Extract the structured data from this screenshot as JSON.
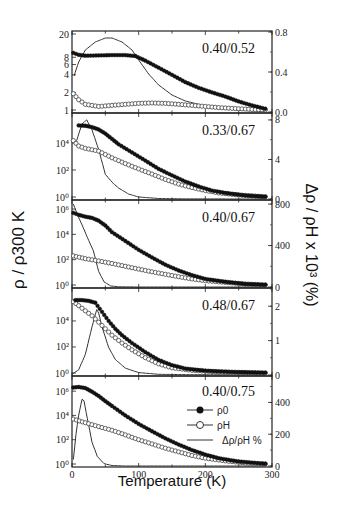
{
  "chart_data": {
    "type": "line",
    "xlabel": "Temperature (K)",
    "ylabel_left": "ρ / ρ300 K",
    "ylabel_right": "Δρ / ρH x 10³ (%)",
    "xlim": [
      0,
      300
    ],
    "xticks": [
      0,
      100,
      200,
      300
    ],
    "legend": {
      "panel": 4,
      "entries": [
        {
          "label": "ρ0",
          "marker": "filled-circle"
        },
        {
          "label": "ρH",
          "marker": "open-circle"
        },
        {
          "label": "Δρ/ρH %",
          "marker": "line"
        }
      ]
    },
    "panels": [
      {
        "label": "0.40/0.52",
        "left_scale": "log",
        "left_ylim": [
          1,
          20
        ],
        "left_ticks": [
          {
            "v": 1,
            "t": "1"
          },
          {
            "v": 2,
            "t": "2"
          },
          {
            "v": 4,
            "t": "4"
          },
          {
            "v": 6,
            "t": "6"
          },
          {
            "v": 8,
            "t": "8"
          },
          {
            "v": 20,
            "t": "20"
          }
        ],
        "right_ylim": [
          0,
          0.8
        ],
        "right_ticks": [
          {
            "v": 0,
            "t": "0.0"
          },
          {
            "v": 0.4,
            "t": "0.4"
          },
          {
            "v": 0.8,
            "t": "0.8"
          }
        ],
        "rho0": [
          [
            2,
            9.5
          ],
          [
            10,
            8.8
          ],
          [
            20,
            8.5
          ],
          [
            40,
            8.6
          ],
          [
            60,
            8.7
          ],
          [
            80,
            8.7
          ],
          [
            95,
            8.4
          ],
          [
            110,
            7.0
          ],
          [
            130,
            5.3
          ],
          [
            150,
            4.0
          ],
          [
            170,
            3.0
          ],
          [
            190,
            2.4
          ],
          [
            210,
            2.0
          ],
          [
            230,
            1.7
          ],
          [
            250,
            1.4
          ],
          [
            270,
            1.2
          ],
          [
            290,
            1.05
          ]
        ],
        "rhoH": [
          [
            2,
            1.9
          ],
          [
            10,
            1.5
          ],
          [
            20,
            1.25
          ],
          [
            40,
            1.15
          ],
          [
            60,
            1.2
          ],
          [
            80,
            1.25
          ],
          [
            100,
            1.3
          ],
          [
            120,
            1.32
          ],
          [
            140,
            1.3
          ],
          [
            160,
            1.25
          ],
          [
            180,
            1.2
          ],
          [
            200,
            1.15
          ],
          [
            220,
            1.1
          ],
          [
            250,
            1.05
          ],
          [
            290,
            1.0
          ]
        ],
        "drho": [
          [
            3,
            0.36
          ],
          [
            10,
            0.5
          ],
          [
            20,
            0.62
          ],
          [
            35,
            0.7
          ],
          [
            50,
            0.74
          ],
          [
            60,
            0.74
          ],
          [
            75,
            0.7
          ],
          [
            90,
            0.62
          ],
          [
            100,
            0.52
          ],
          [
            115,
            0.38
          ],
          [
            130,
            0.27
          ],
          [
            150,
            0.17
          ],
          [
            170,
            0.11
          ],
          [
            200,
            0.06
          ],
          [
            230,
            0.03
          ],
          [
            260,
            0.015
          ],
          [
            290,
            0.005
          ]
        ]
      },
      {
        "label": "0.33/0.67",
        "left_scale": "log",
        "left_ylim": [
          1,
          1000000
        ],
        "left_ticks": [
          {
            "v": 1,
            "t": "10⁰"
          },
          {
            "v": 100,
            "t": "10²"
          },
          {
            "v": 10000,
            "t": "10⁴"
          }
        ],
        "right_ylim": [
          0,
          8.6
        ],
        "right_ticks": [
          {
            "v": 0,
            "t": "0"
          },
          {
            "v": 4,
            "t": "4"
          },
          {
            "v": 8,
            "t": "8"
          }
        ],
        "rho0": [
          [
            10,
            200000
          ],
          [
            20,
            190000
          ],
          [
            30,
            150000
          ],
          [
            40,
            100000
          ],
          [
            50,
            50000
          ],
          [
            60,
            20000
          ],
          [
            70,
            8000
          ],
          [
            90,
            2000
          ],
          [
            110,
            500
          ],
          [
            130,
            120
          ],
          [
            150,
            40
          ],
          [
            170,
            14
          ],
          [
            190,
            6
          ],
          [
            210,
            3
          ],
          [
            230,
            2
          ],
          [
            260,
            1.3
          ],
          [
            290,
            1.05
          ]
        ],
        "rhoH": [
          [
            2,
            15000
          ],
          [
            10,
            6000
          ],
          [
            20,
            4000
          ],
          [
            40,
            2500
          ],
          [
            60,
            800
          ],
          [
            80,
            300
          ],
          [
            100,
            120
          ],
          [
            120,
            50
          ],
          [
            140,
            20
          ],
          [
            160,
            9
          ],
          [
            180,
            5
          ],
          [
            200,
            3
          ],
          [
            220,
            2
          ],
          [
            250,
            1.4
          ],
          [
            290,
            1.05
          ]
        ],
        "drho": [
          [
            5,
            5.5
          ],
          [
            15,
            7.6
          ],
          [
            22,
            8.0
          ],
          [
            30,
            7.0
          ],
          [
            40,
            5.0
          ],
          [
            50,
            2.5
          ],
          [
            60,
            1.7
          ],
          [
            70,
            1.1
          ],
          [
            85,
            0.5
          ],
          [
            100,
            0.2
          ],
          [
            130,
            0.05
          ],
          [
            170,
            0.01
          ],
          [
            290,
            0.0
          ]
        ]
      },
      {
        "label": "0.40/0.67",
        "left_scale": "log",
        "left_ylim": [
          1,
          3000000
        ],
        "left_ticks": [
          {
            "v": 1,
            "t": "10⁰"
          },
          {
            "v": 100,
            "t": "10²"
          },
          {
            "v": 10000,
            "t": "10⁴"
          },
          {
            "v": 1000000,
            "t": "10⁶"
          }
        ],
        "right_ylim": [
          0,
          830
        ],
        "right_ticks": [
          {
            "v": 0,
            "t": "0"
          },
          {
            "v": 400,
            "t": "400"
          },
          {
            "v": 800,
            "t": "800"
          }
        ],
        "rho0": [
          [
            2,
            500000
          ],
          [
            10,
            350000
          ],
          [
            20,
            250000
          ],
          [
            30,
            200000
          ],
          [
            40,
            120000
          ],
          [
            50,
            50000
          ],
          [
            60,
            15000
          ],
          [
            80,
            3000
          ],
          [
            100,
            600
          ],
          [
            120,
            150
          ],
          [
            140,
            40
          ],
          [
            160,
            14
          ],
          [
            180,
            6
          ],
          [
            200,
            3
          ],
          [
            230,
            1.8
          ],
          [
            260,
            1.2
          ],
          [
            290,
            1.05
          ]
        ],
        "rhoH": [
          [
            2,
            200
          ],
          [
            20,
            120
          ],
          [
            40,
            80
          ],
          [
            60,
            50
          ],
          [
            80,
            30
          ],
          [
            100,
            18
          ],
          [
            120,
            11
          ],
          [
            140,
            7
          ],
          [
            160,
            4.5
          ],
          [
            180,
            3
          ],
          [
            200,
            2.2
          ],
          [
            230,
            1.6
          ],
          [
            260,
            1.2
          ],
          [
            290,
            1.0
          ]
        ],
        "drho": [
          [
            2,
            800
          ],
          [
            8,
            700
          ],
          [
            15,
            600
          ],
          [
            25,
            450
          ],
          [
            32,
            350
          ],
          [
            40,
            150
          ],
          [
            48,
            50
          ],
          [
            58,
            10
          ],
          [
            70,
            2
          ],
          [
            100,
            0
          ],
          [
            290,
            0
          ]
        ]
      },
      {
        "label": "0.48/0.67",
        "left_scale": "log",
        "left_ylim": [
          1,
          2000000
        ],
        "left_ticks": [
          {
            "v": 1,
            "t": "10⁰"
          },
          {
            "v": 100,
            "t": "10²"
          },
          {
            "v": 10000,
            "t": "10⁴"
          }
        ],
        "right_ylim": [
          0,
          2.5
        ],
        "right_ticks": [
          {
            "v": 0,
            "t": "0"
          },
          {
            "v": 1,
            "t": "1"
          },
          {
            "v": 2,
            "t": "2"
          }
        ],
        "rho0": [
          [
            5,
            400000
          ],
          [
            15,
            400000
          ],
          [
            25,
            350000
          ],
          [
            35,
            250000
          ],
          [
            45,
            50000
          ],
          [
            55,
            10000
          ],
          [
            65,
            2500
          ],
          [
            75,
            800
          ],
          [
            90,
            200
          ],
          [
            110,
            40
          ],
          [
            130,
            10
          ],
          [
            150,
            4
          ],
          [
            170,
            2.2
          ],
          [
            200,
            1.5
          ],
          [
            240,
            1.2
          ],
          [
            290,
            1.05
          ]
        ],
        "rhoH": [
          [
            2,
            300000
          ],
          [
            10,
            150000
          ],
          [
            20,
            60000
          ],
          [
            30,
            25000
          ],
          [
            40,
            8000
          ],
          [
            50,
            2500
          ],
          [
            60,
            800
          ],
          [
            75,
            200
          ],
          [
            90,
            60
          ],
          [
            110,
            15
          ],
          [
            130,
            5
          ],
          [
            150,
            2.5
          ],
          [
            180,
            1.6
          ],
          [
            220,
            1.2
          ],
          [
            290,
            1.0
          ]
        ],
        "drho": [
          [
            0,
            0.02
          ],
          [
            10,
            0.15
          ],
          [
            20,
            0.6
          ],
          [
            30,
            1.4
          ],
          [
            37,
            1.9
          ],
          [
            40,
            1.8
          ],
          [
            45,
            1.4
          ],
          [
            55,
            0.8
          ],
          [
            65,
            0.45
          ],
          [
            80,
            0.2
          ],
          [
            100,
            0.07
          ],
          [
            130,
            0.02
          ],
          [
            170,
            0.01
          ],
          [
            290,
            0.0
          ]
        ]
      },
      {
        "label": "0.40/0.75",
        "left_scale": "log",
        "left_ylim": [
          1,
          10000000
        ],
        "left_ticks": [
          {
            "v": 1,
            "t": "10⁰"
          },
          {
            "v": 100,
            "t": "10²"
          },
          {
            "v": 10000,
            "t": "10⁴"
          },
          {
            "v": 1000000,
            "t": "10⁶"
          }
        ],
        "right_ylim": [
          0,
          560
        ],
        "right_ticks": [
          {
            "v": 0,
            "t": "0"
          },
          {
            "v": 200,
            "t": "200"
          },
          {
            "v": 400,
            "t": "400"
          }
        ],
        "rho0": [
          [
            2,
            2000000
          ],
          [
            10,
            2200000
          ],
          [
            20,
            1800000
          ],
          [
            30,
            900000
          ],
          [
            40,
            400000
          ],
          [
            50,
            150000
          ],
          [
            60,
            60000
          ],
          [
            80,
            10000
          ],
          [
            100,
            2000
          ],
          [
            120,
            500
          ],
          [
            140,
            130
          ],
          [
            160,
            40
          ],
          [
            180,
            14
          ],
          [
            200,
            6
          ],
          [
            220,
            3
          ],
          [
            250,
            1.6
          ],
          [
            290,
            1.05
          ]
        ],
        "rhoH": [
          [
            2,
            5000
          ],
          [
            20,
            2500
          ],
          [
            40,
            1200
          ],
          [
            60,
            600
          ],
          [
            80,
            250
          ],
          [
            100,
            100
          ],
          [
            120,
            45
          ],
          [
            140,
            20
          ],
          [
            160,
            10
          ],
          [
            180,
            5
          ],
          [
            200,
            3
          ],
          [
            230,
            1.8
          ],
          [
            260,
            1.2
          ],
          [
            290,
            1.0
          ]
        ],
        "drho": [
          [
            2,
            40
          ],
          [
            6,
            200
          ],
          [
            10,
            320
          ],
          [
            15,
            420
          ],
          [
            18,
            410
          ],
          [
            23,
            300
          ],
          [
            30,
            150
          ],
          [
            38,
            60
          ],
          [
            48,
            15
          ],
          [
            60,
            3
          ],
          [
            80,
            0
          ],
          [
            290,
            0
          ]
        ]
      }
    ]
  }
}
